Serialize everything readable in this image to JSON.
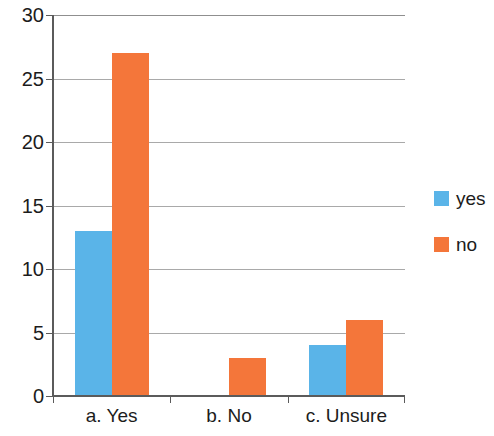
{
  "chart_data": {
    "type": "bar",
    "title": "",
    "xlabel": "",
    "ylabel": "",
    "categories": [
      "a. Yes",
      "b. No",
      "c. Unsure"
    ],
    "series": [
      {
        "name": "yes",
        "color": "#5ab4e8",
        "values": [
          13,
          0,
          4
        ]
      },
      {
        "name": "no",
        "color": "#f4763a",
        "values": [
          27,
          3,
          6
        ]
      }
    ],
    "ylim": [
      0,
      30
    ],
    "ytick_step": 5,
    "ytick_labels": [
      "0",
      "5",
      "10",
      "15",
      "20",
      "25",
      "30"
    ],
    "grid": true,
    "grid_color": "#a9a9a9",
    "legend_position": "right",
    "axis_color": "#5b5b5b",
    "background": "#ffffff"
  },
  "legend": {
    "items": [
      {
        "label": "yes",
        "swatch": "legend-swatch-yes"
      },
      {
        "label": "no",
        "swatch": "legend-swatch-no"
      }
    ]
  }
}
